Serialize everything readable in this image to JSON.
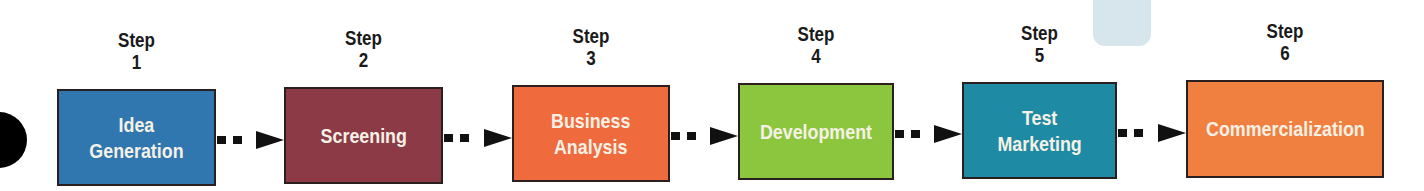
{
  "diagram": {
    "type": "process-flow",
    "steps": [
      {
        "step_word": "Step",
        "number": "1",
        "label": "Idea\nGeneration",
        "color": "#2f77ae"
      },
      {
        "step_word": "Step",
        "number": "2",
        "label": "Screening",
        "color": "#8b3a46"
      },
      {
        "step_word": "Step",
        "number": "3",
        "label": "Business\nAnalysis",
        "color": "#ef6a3c"
      },
      {
        "step_word": "Step",
        "number": "4",
        "label": "Development",
        "color": "#8cc63f"
      },
      {
        "step_word": "Step",
        "number": "5",
        "label": "Test\nMarketing",
        "color": "#1e8aa4"
      },
      {
        "step_word": "Step",
        "number": "6",
        "label": "Commercialization",
        "color": "#f08040"
      }
    ],
    "connector": "dashed-arrow"
  }
}
